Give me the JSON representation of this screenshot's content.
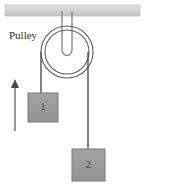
{
  "figure": {
    "labels": {
      "pulley": "Pulley",
      "block_one": "1",
      "block_two": "2"
    },
    "colors": {
      "ceiling_fill": "#d2d2d2",
      "ceiling_stroke": "#b8b8b8",
      "block_fill": "#9a9a9a",
      "block_stroke": "#7d7d7d",
      "rope": "#555555",
      "pulley_stroke": "#555555",
      "pulley_fill": "#ffffff",
      "arrow": "#777777",
      "text": "#2b2b2b",
      "background": "#ffffff"
    },
    "geometry": {
      "ceiling": {
        "x": 5,
        "y": 5,
        "width": 135,
        "height": 11
      },
      "hook": {
        "center_x": 67,
        "top_y": 10,
        "bottom_y": 56,
        "half_width": 5
      },
      "pulley": {
        "cx": 67,
        "cy": 52,
        "r_outer": 26,
        "r_inner": 22
      },
      "rope_left": {
        "x": 41,
        "y_top": 52,
        "y_bottom": 93
      },
      "rope_right": {
        "x": 88,
        "y_top": 52,
        "y_bottom": 149
      },
      "block_one": {
        "x": 28,
        "y": 93,
        "width": 30,
        "height": 29
      },
      "block_two": {
        "x": 72,
        "y": 149,
        "width": 33,
        "height": 32
      },
      "arrow": {
        "x": 15,
        "y_tail": 131,
        "y_head": 81
      },
      "pulley_label_anchor": {
        "x": 9,
        "y": 39
      }
    },
    "arrow_meaning": "upward-direction-indicator"
  }
}
